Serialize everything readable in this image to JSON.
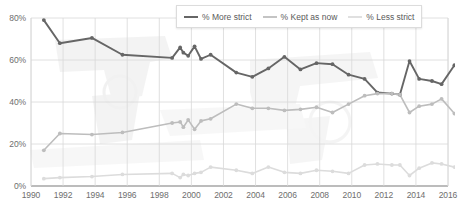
{
  "chart_data": {
    "type": "line",
    "title": "",
    "subtitle": "",
    "xlabel": "",
    "ylabel": "",
    "xlim": [
      1990,
      2016
    ],
    "ylim": [
      0,
      80
    ],
    "ytick_labels": [
      "0%",
      "20%",
      "40%",
      "60%",
      "80%"
    ],
    "ytick_values": [
      0,
      20,
      40,
      60,
      80
    ],
    "xtick_labels": [
      "1990",
      "1992",
      "1994",
      "1996",
      "1998",
      "2000",
      "2002",
      "2004",
      "2006",
      "2008",
      "2010",
      "2012",
      "2014",
      "2016"
    ],
    "xtick_values": [
      1990,
      1992,
      1994,
      1996,
      1998,
      2000,
      2002,
      2004,
      2006,
      2008,
      2010,
      2012,
      2014,
      2016
    ],
    "grid": true,
    "legend_position": "top-right",
    "markers": true,
    "series": [
      {
        "name": "% More strict",
        "color": "#666666",
        "width": 1.9,
        "points": [
          [
            1990.8,
            79.0
          ],
          [
            1991.8,
            68.0
          ],
          [
            1993.8,
            70.5
          ],
          [
            1995.7,
            62.5
          ],
          [
            1998.8,
            61.0
          ],
          [
            1999.3,
            66.0
          ],
          [
            1999.5,
            63.5
          ],
          [
            1999.8,
            62.0
          ],
          [
            2000.2,
            66.5
          ],
          [
            2000.6,
            60.5
          ],
          [
            2001.2,
            62.5
          ],
          [
            2002.8,
            54.0
          ],
          [
            2003.8,
            52.0
          ],
          [
            2004.8,
            56.0
          ],
          [
            2005.8,
            61.5
          ],
          [
            2006.8,
            55.5
          ],
          [
            2007.8,
            58.5
          ],
          [
            2008.8,
            58.0
          ],
          [
            2009.8,
            53.0
          ],
          [
            2010.8,
            51.0
          ],
          [
            2011.6,
            44.5
          ],
          [
            2012.5,
            44.0
          ],
          [
            2013.0,
            43.5
          ],
          [
            2013.6,
            59.5
          ],
          [
            2014.2,
            51.0
          ],
          [
            2015.0,
            50.0
          ],
          [
            2015.6,
            48.5
          ],
          [
            2016.4,
            57.5
          ]
        ]
      },
      {
        "name": "% Kept as now",
        "color": "#bdbdbd",
        "width": 1.6,
        "points": [
          [
            1990.8,
            17.0
          ],
          [
            1991.8,
            25.0
          ],
          [
            1993.8,
            24.5
          ],
          [
            1995.7,
            25.5
          ],
          [
            1998.8,
            30.0
          ],
          [
            1999.3,
            30.5
          ],
          [
            1999.5,
            28.0
          ],
          [
            1999.8,
            31.5
          ],
          [
            2000.2,
            27.0
          ],
          [
            2000.6,
            31.0
          ],
          [
            2001.2,
            32.0
          ],
          [
            2002.8,
            39.0
          ],
          [
            2003.8,
            37.0
          ],
          [
            2004.8,
            37.0
          ],
          [
            2005.8,
            36.0
          ],
          [
            2006.8,
            36.5
          ],
          [
            2007.8,
            37.5
          ],
          [
            2008.8,
            35.0
          ],
          [
            2009.8,
            39.0
          ],
          [
            2010.8,
            43.0
          ],
          [
            2011.6,
            44.0
          ],
          [
            2012.5,
            44.0
          ],
          [
            2013.0,
            43.5
          ],
          [
            2013.6,
            35.0
          ],
          [
            2014.2,
            38.0
          ],
          [
            2015.0,
            39.0
          ],
          [
            2015.6,
            41.5
          ],
          [
            2016.4,
            34.5
          ]
        ]
      },
      {
        "name": "% Less strict",
        "color": "#dcdcdc",
        "width": 1.6,
        "points": [
          [
            1990.8,
            3.5
          ],
          [
            1991.8,
            4.0
          ],
          [
            1993.8,
            4.5
          ],
          [
            1995.7,
            5.5
          ],
          [
            1998.8,
            6.0
          ],
          [
            1999.3,
            4.0
          ],
          [
            1999.5,
            5.5
          ],
          [
            1999.8,
            5.0
          ],
          [
            2000.2,
            6.0
          ],
          [
            2000.6,
            6.5
          ],
          [
            2001.2,
            9.0
          ],
          [
            2002.8,
            7.5
          ],
          [
            2003.8,
            6.0
          ],
          [
            2004.8,
            9.0
          ],
          [
            2005.8,
            6.5
          ],
          [
            2006.8,
            6.0
          ],
          [
            2007.8,
            7.5
          ],
          [
            2008.8,
            7.0
          ],
          [
            2009.8,
            6.0
          ],
          [
            2010.8,
            10.0
          ],
          [
            2011.6,
            10.5
          ],
          [
            2012.5,
            10.0
          ],
          [
            2013.0,
            10.0
          ],
          [
            2013.6,
            5.0
          ],
          [
            2014.2,
            8.5
          ],
          [
            2015.0,
            11.0
          ],
          [
            2015.6,
            10.5
          ],
          [
            2016.4,
            9.0
          ]
        ]
      }
    ]
  },
  "legend": {
    "items": [
      {
        "label": "% More strict"
      },
      {
        "label": "% Kept as now"
      },
      {
        "label": "% Less strict"
      }
    ]
  },
  "colors": {
    "more_strict": "#666666",
    "kept_as_now": "#bdbdbd",
    "less_strict": "#dcdcdc",
    "grid": "#d8d8d8",
    "axis": "#7a7a7a",
    "tick_text": "#6e6e6e"
  }
}
